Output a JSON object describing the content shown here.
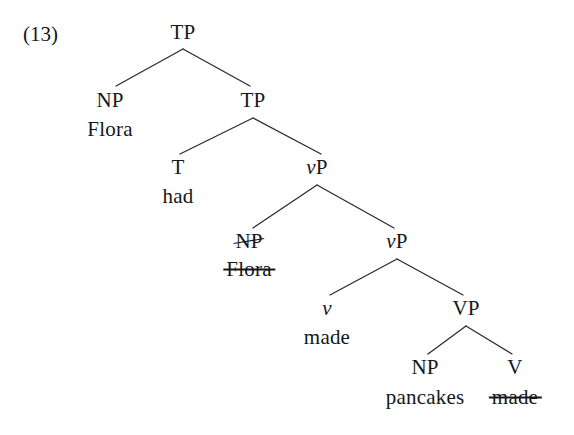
{
  "figure": {
    "example_number": "(13)",
    "type": "syntactic-tree",
    "background_color": "#ffffff",
    "line_color": "#2a2c31",
    "text_color": "#15161a"
  },
  "tree": {
    "nodes": [
      {
        "id": "tp-root",
        "label": "TP",
        "x": 183,
        "y": 32,
        "italic_first_char": false,
        "struck": false
      },
      {
        "id": "np-subject",
        "label": "NP",
        "x": 110,
        "y": 100,
        "italic_first_char": false,
        "struck": false
      },
      {
        "id": "flora-top",
        "label": "Flora",
        "x": 110,
        "y": 129,
        "italic_first_char": false,
        "struck": false
      },
      {
        "id": "tp-lower",
        "label": "TP",
        "x": 253,
        "y": 100,
        "italic_first_char": false,
        "struck": false
      },
      {
        "id": "t-head",
        "label": "T",
        "x": 178,
        "y": 167,
        "italic_first_char": false,
        "struck": false
      },
      {
        "id": "had",
        "label": "had",
        "x": 178,
        "y": 196,
        "italic_first_char": false,
        "struck": false
      },
      {
        "id": "vp-upper",
        "label": "vP",
        "x": 317,
        "y": 167,
        "italic_first_char": true,
        "struck": false
      },
      {
        "id": "np-trace",
        "label": "NP",
        "x": 249,
        "y": 241,
        "italic_first_char": false,
        "struck": true
      },
      {
        "id": "flora-trace",
        "label": "Flora",
        "x": 249,
        "y": 269,
        "italic_first_char": false,
        "struck": true
      },
      {
        "id": "vp-lower",
        "label": "vP",
        "x": 397,
        "y": 241,
        "italic_first_char": true,
        "struck": false
      },
      {
        "id": "v-head",
        "label": "v",
        "x": 327,
        "y": 308,
        "italic_first_char": true,
        "struck": false
      },
      {
        "id": "made-v",
        "label": "made",
        "x": 327,
        "y": 337,
        "italic_first_char": false,
        "struck": false
      },
      {
        "id": "vp-phrase",
        "label": "VP",
        "x": 466,
        "y": 308,
        "italic_first_char": false,
        "struck": false
      },
      {
        "id": "np-object",
        "label": "NP",
        "x": 425,
        "y": 367,
        "italic_first_char": false,
        "struck": false
      },
      {
        "id": "pancakes",
        "label": "pancakes",
        "x": 425,
        "y": 397,
        "italic_first_char": false,
        "struck": false
      },
      {
        "id": "v-trace",
        "label": "V",
        "x": 515,
        "y": 367,
        "italic_first_char": false,
        "struck": false
      },
      {
        "id": "made-trace",
        "label": "made",
        "x": 515,
        "y": 397,
        "italic_first_char": false,
        "struck": true
      }
    ],
    "branches": [
      {
        "id": "tp-root-to-np-subject",
        "x1": 183,
        "y1": 49,
        "x2": 116,
        "y2": 86
      },
      {
        "id": "tp-root-to-tp-lower",
        "x1": 183,
        "y1": 49,
        "x2": 250,
        "y2": 86
      },
      {
        "id": "tp-lower-to-t",
        "x1": 253,
        "y1": 118,
        "x2": 180,
        "y2": 154
      },
      {
        "id": "tp-lower-to-vp",
        "x1": 253,
        "y1": 118,
        "x2": 321,
        "y2": 154
      },
      {
        "id": "vp-upper-to-np-trace",
        "x1": 317,
        "y1": 185,
        "x2": 253,
        "y2": 228
      },
      {
        "id": "vp-upper-to-vp-lower",
        "x1": 317,
        "y1": 185,
        "x2": 394,
        "y2": 228
      },
      {
        "id": "vp-lower-to-v",
        "x1": 397,
        "y1": 259,
        "x2": 330,
        "y2": 295
      },
      {
        "id": "vp-lower-to-vp-phrase",
        "x1": 397,
        "y1": 259,
        "x2": 463,
        "y2": 295
      },
      {
        "id": "vp-phrase-to-np",
        "x1": 466,
        "y1": 326,
        "x2": 428,
        "y2": 354
      },
      {
        "id": "vp-phrase-to-v-trace",
        "x1": 466,
        "y1": 326,
        "x2": 512,
        "y2": 354
      }
    ]
  }
}
